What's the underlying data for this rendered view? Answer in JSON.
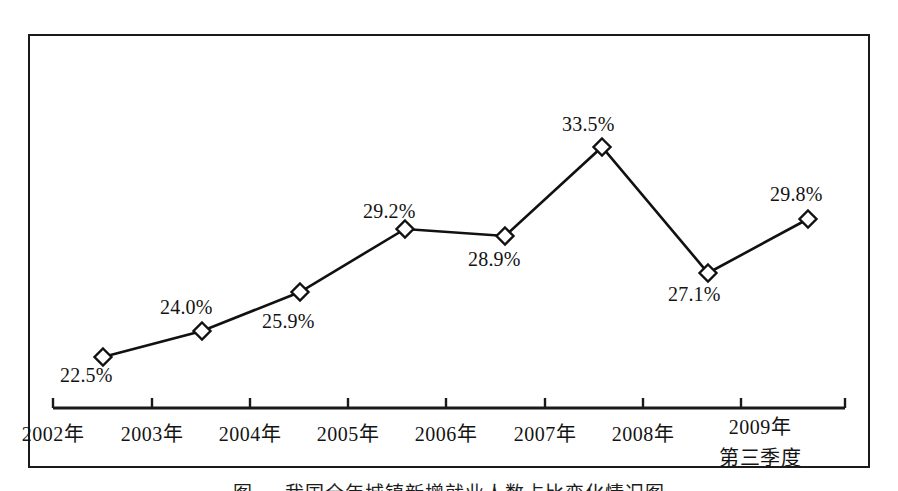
{
  "figure": {
    "caption": "图  一   我国全年城镇新增就业人数占比变化情况图",
    "frame_color": "#1a1a1a",
    "line_color": "#111111",
    "marker_fill": "#ffffff",
    "background": "#ffffff"
  },
  "chart_data": {
    "type": "line",
    "title": "",
    "xlabel": "",
    "ylabel": "",
    "grid": false,
    "legend": "none",
    "categories": [
      "2002年",
      "2003年",
      "2004年",
      "2005年",
      "2006年",
      "2007年",
      "2008年",
      "2009年"
    ],
    "category_sublabels": [
      "",
      "",
      "",
      "",
      "",
      "",
      "",
      "第三季度"
    ],
    "values": [
      22.5,
      24.0,
      25.9,
      29.2,
      28.9,
      33.5,
      27.1,
      29.8
    ],
    "value_labels": [
      "22.5%",
      "24.0%",
      "25.9%",
      "29.2%",
      "28.9%",
      "33.5%",
      "27.1%",
      "29.8%"
    ],
    "ylim": [
      21.0,
      35.0
    ],
    "marker": "diamond-open",
    "label_positions": [
      "below-left",
      "above-left",
      "below-right",
      "above-left",
      "below-right",
      "above-left",
      "below-left",
      "above-left"
    ],
    "points_px": [
      {
        "x": 103,
        "y": 357
      },
      {
        "x": 202,
        "y": 331
      },
      {
        "x": 300,
        "y": 292
      },
      {
        "x": 405,
        "y": 229
      },
      {
        "x": 505,
        "y": 236
      },
      {
        "x": 602,
        "y": 147
      },
      {
        "x": 708,
        "y": 273
      },
      {
        "x": 808,
        "y": 219
      }
    ],
    "label_px": [
      {
        "x": 60,
        "y": 364
      },
      {
        "x": 160,
        "y": 296
      },
      {
        "x": 262,
        "y": 310
      },
      {
        "x": 363,
        "y": 200
      },
      {
        "x": 468,
        "y": 248
      },
      {
        "x": 562,
        "y": 113
      },
      {
        "x": 668,
        "y": 283
      },
      {
        "x": 770,
        "y": 183
      }
    ],
    "tick_px": [
      53,
      152,
      250,
      348,
      446,
      545,
      643,
      741
    ],
    "axis_px": {
      "y": 408,
      "x_start": 53,
      "x_end": 845,
      "tick_height": 10
    },
    "axis_label_px": [
      {
        "x": 53,
        "y": 418
      },
      {
        "x": 152,
        "y": 418
      },
      {
        "x": 250,
        "y": 418
      },
      {
        "x": 348,
        "y": 418
      },
      {
        "x": 446,
        "y": 418
      },
      {
        "x": 545,
        "y": 418
      },
      {
        "x": 643,
        "y": 418
      },
      {
        "x": 760,
        "y": 411
      }
    ]
  }
}
